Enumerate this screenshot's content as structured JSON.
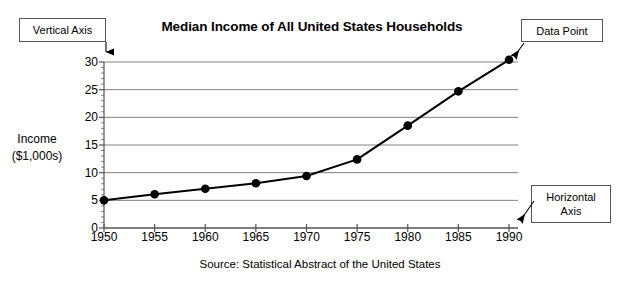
{
  "chart_data": {
    "type": "line",
    "title": "Median Income of All United States Households",
    "xlabel": "",
    "ylabel": "Income ($1,000s)",
    "ylabel_line1": "Income",
    "ylabel_line2": "($1,000s)",
    "source": "Source:  Statistical Abstract of the United States",
    "categories": [
      1950,
      1955,
      1960,
      1965,
      1970,
      1975,
      1980,
      1985,
      1990
    ],
    "x_tick_labels": [
      "1950",
      "1955",
      "1960",
      "1965",
      "1970",
      "1975",
      "1980",
      "1985",
      "1990"
    ],
    "values": [
      5.0,
      6.1,
      7.1,
      8.1,
      9.4,
      12.4,
      18.5,
      24.7,
      30.4
    ],
    "y_tick_labels": [
      "0",
      "5",
      "10",
      "15",
      "20",
      "25",
      "30"
    ],
    "y_ticks": [
      0,
      5,
      10,
      15,
      20,
      25,
      30
    ],
    "y_minor_tick_step": 1,
    "xlim": [
      1950,
      1990
    ],
    "ylim": [
      0,
      30
    ],
    "grid": "horizontal",
    "legend": "none",
    "marker": "filled-circle",
    "line_color": "#000000",
    "grid_color": "#808080",
    "axis_color": "#555555",
    "annotations": [
      {
        "label": "Vertical Axis",
        "points_to": "y-axis top",
        "box": true
      },
      {
        "label": "Data Point",
        "points_to": "1990 marker",
        "box": true
      },
      {
        "label": "Horizontal Axis",
        "label_line1": "Horizontal",
        "label_line2": "Axis",
        "points_to": "x-axis right end",
        "box": true
      }
    ]
  },
  "callouts": {
    "vertical_axis": "Vertical Axis",
    "data_point": "Data Point",
    "horizontal_axis_line1": "Horizontal",
    "horizontal_axis_line2": "Axis"
  }
}
